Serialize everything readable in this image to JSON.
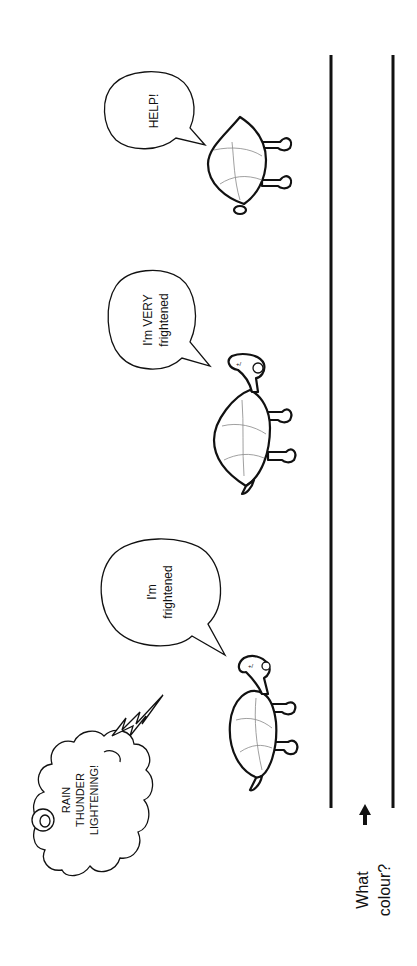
{
  "worksheet": {
    "orientation": "rotated-90-ccw",
    "thought_cloud": {
      "lines": [
        "RAIN",
        "THUNDER",
        "LIGHTENING!"
      ]
    },
    "speech_bubbles": [
      {
        "lines": [
          "I'm",
          "frightened"
        ]
      },
      {
        "lines": [
          "I'm VERY",
          "frightened"
        ]
      },
      {
        "lines": [
          "HELP!"
        ]
      }
    ],
    "colour_prompt": {
      "lines": [
        "What",
        "colour?"
      ]
    },
    "colors": {
      "ink": "#111111",
      "shell_pattern": "#888888",
      "background": "#ffffff"
    }
  }
}
